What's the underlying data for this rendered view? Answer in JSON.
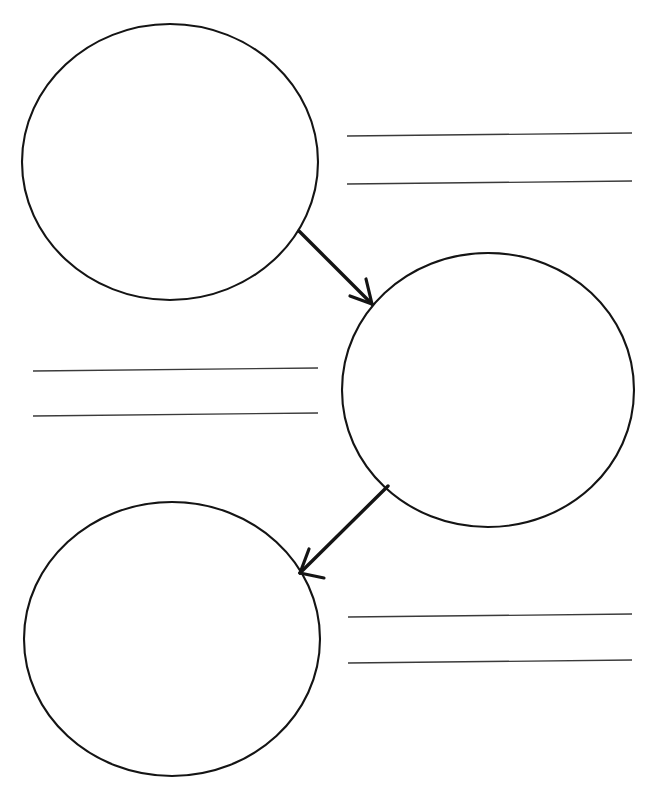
{
  "page": {
    "width": 659,
    "height": 805,
    "background_color": "#ffffff",
    "ink_color": "#141414",
    "rule_line_color": "#3a3a3a",
    "header_text": ""
  },
  "diagram": {
    "type": "flow-sequence",
    "node_count": 3,
    "arrow_count": 2,
    "line_group_count": 3,
    "nodes": [
      {
        "id": "circle-1",
        "label": "",
        "position": "top-left",
        "cx": 170,
        "cy": 162,
        "rx": 148,
        "ry": 138
      },
      {
        "id": "circle-2",
        "label": "",
        "position": "middle-right",
        "cx": 488,
        "cy": 390,
        "rx": 146,
        "ry": 137
      },
      {
        "id": "circle-3",
        "label": "",
        "position": "bottom-left",
        "cx": 172,
        "cy": 639,
        "rx": 148,
        "ry": 137
      }
    ],
    "arrows": [
      {
        "id": "arrow-1",
        "from": "circle-1",
        "to": "circle-2",
        "x1": 299,
        "y1": 231,
        "x2": 372,
        "y2": 304,
        "direction": "down-right"
      },
      {
        "id": "arrow-2",
        "from": "circle-2",
        "to": "circle-3",
        "x1": 388,
        "y1": 486,
        "x2": 300,
        "y2": 573,
        "direction": "down-left"
      }
    ],
    "line_groups": [
      {
        "id": "lines-top-right",
        "position": "top-right",
        "line_count": 2,
        "x_start": 347,
        "x_end": 632,
        "y_values": [
          136,
          183
        ],
        "text": [
          "",
          ""
        ]
      },
      {
        "id": "lines-middle-left",
        "position": "middle-left",
        "line_count": 2,
        "x_start": 33,
        "x_end": 318,
        "y_values": [
          370,
          415
        ],
        "text": [
          "",
          ""
        ]
      },
      {
        "id": "lines-bottom-right",
        "position": "bottom-right",
        "line_count": 2,
        "x_start": 348,
        "x_end": 632,
        "y_values": [
          616,
          662
        ],
        "text": [
          "",
          ""
        ]
      }
    ]
  }
}
